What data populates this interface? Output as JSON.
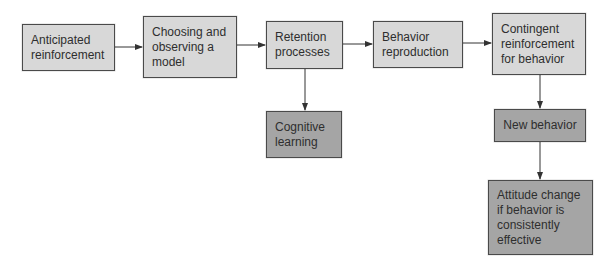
{
  "diagram": {
    "type": "flowchart",
    "colors": {
      "light_box": "#d8d8d8",
      "dark_box": "#a5a5a5",
      "border": "#4a4a4a",
      "arrow": "#333333",
      "text": "#2e2e2e"
    },
    "nodes": [
      {
        "id": "anticipated",
        "lines": [
          "Anticipated",
          "reinforcement"
        ],
        "shade": "light"
      },
      {
        "id": "choosing",
        "lines": [
          "Choosing and",
          "observing a",
          "model"
        ],
        "shade": "light"
      },
      {
        "id": "retention",
        "lines": [
          "Retention",
          "processes"
        ],
        "shade": "light"
      },
      {
        "id": "reproduction",
        "lines": [
          "Behavior",
          "reproduction"
        ],
        "shade": "light"
      },
      {
        "id": "contingent",
        "lines": [
          "Contingent",
          "reinforcement",
          "for behavior"
        ],
        "shade": "light"
      },
      {
        "id": "cognitive",
        "lines": [
          "Cognitive",
          "learning"
        ],
        "shade": "dark"
      },
      {
        "id": "new_behavior",
        "lines": [
          "New behavior"
        ],
        "shade": "dark"
      },
      {
        "id": "attitude",
        "lines": [
          "Attitude change",
          "if behavior is",
          "consistently",
          "effective"
        ],
        "shade": "dark"
      }
    ],
    "edges": [
      {
        "from": "anticipated",
        "to": "choosing"
      },
      {
        "from": "choosing",
        "to": "retention"
      },
      {
        "from": "retention",
        "to": "reproduction"
      },
      {
        "from": "reproduction",
        "to": "contingent"
      },
      {
        "from": "retention",
        "to": "cognitive"
      },
      {
        "from": "contingent",
        "to": "new_behavior"
      },
      {
        "from": "new_behavior",
        "to": "attitude"
      }
    ]
  }
}
